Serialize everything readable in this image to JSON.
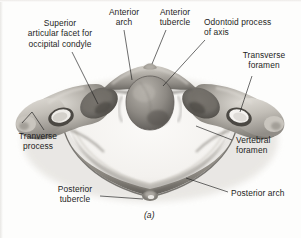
{
  "figure": {
    "caption": "(a)",
    "background_color": "#fdfdfc",
    "ink_color": "#1d1d1d"
  },
  "labels": {
    "superior_articular_facet": "Superior\narticular facet for\noccipital condyle",
    "anterior_arch": "Anterior\narch",
    "anterior_tubercle": "Anterior\ntubercle",
    "odontoid_process": "Odontoid process\nof axis",
    "transverse_foramen": "Transverse\nforamen",
    "tranverse_process": "Tranverse\nprocess",
    "vertebral_foramen": "Vertebral\nforamen",
    "posterior_tubercle": "Posterior\ntubercle",
    "posterior_arch": "Posterior arch"
  }
}
